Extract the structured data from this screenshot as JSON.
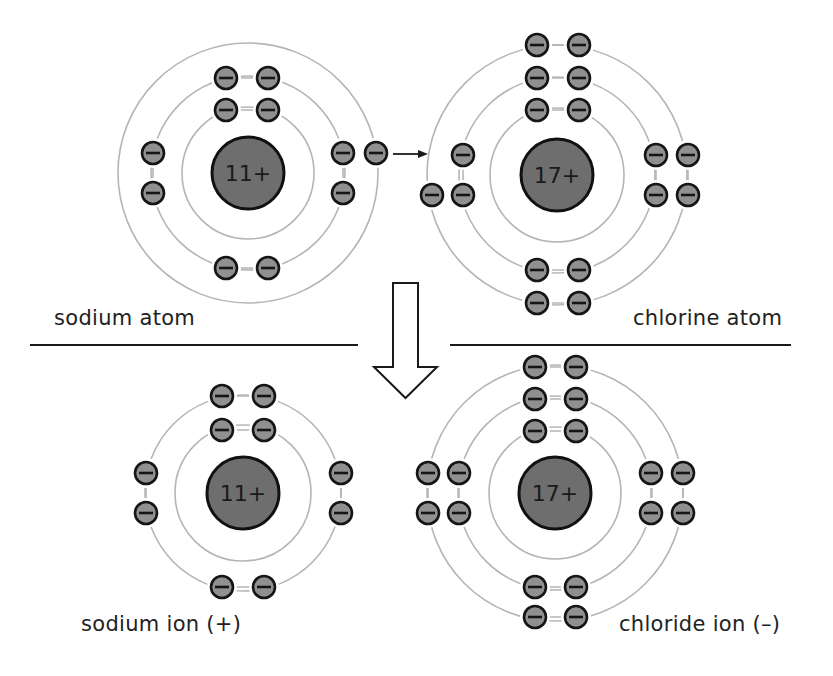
{
  "colors": {
    "shell": "#b5b5b5",
    "nucleus_fill": "#6e6e6e",
    "nucleus_stroke": "#111111",
    "electron_fill": "#909090",
    "electron_stroke": "#151515",
    "line": "#1a1a1a",
    "background": "#ffffff"
  },
  "labels": {
    "sodium_atom": "sodium atom",
    "chlorine_atom": "chlorine atom",
    "sodium_ion": "sodium ion (+)",
    "chloride_ion": "chloride ion (–)"
  },
  "atoms": [
    {
      "id": "sodium-atom",
      "charge_label": "11+",
      "center": [
        248,
        173
      ],
      "nucleus_radius": 36,
      "shell_radii": [
        66,
        97,
        130
      ],
      "electrons": [
        [
          226,
          78
        ],
        [
          268,
          78
        ],
        [
          226,
          110
        ],
        [
          268,
          110
        ],
        [
          153,
          153
        ],
        [
          153,
          193
        ],
        [
          343,
          153
        ],
        [
          343,
          193
        ],
        [
          376,
          153
        ],
        [
          226,
          268
        ],
        [
          268,
          268
        ]
      ],
      "pairs": [
        [
          0,
          1
        ],
        [
          2,
          3
        ],
        [
          9,
          10
        ],
        [
          4,
          5
        ],
        [
          6,
          7
        ]
      ]
    },
    {
      "id": "chlorine-atom",
      "charge_label": "17+",
      "center": [
        557,
        175
      ],
      "nucleus_radius": 36,
      "shell_radii": [
        67,
        98,
        130
      ],
      "electrons": [
        [
          537,
          45
        ],
        [
          579,
          45
        ],
        [
          537,
          78
        ],
        [
          579,
          78
        ],
        [
          537,
          110
        ],
        [
          579,
          110
        ],
        [
          463,
          155
        ],
        [
          463,
          195
        ],
        [
          432,
          195
        ],
        [
          656,
          155
        ],
        [
          656,
          195
        ],
        [
          688,
          155
        ],
        [
          688,
          195
        ],
        [
          537,
          270
        ],
        [
          579,
          270
        ],
        [
          537,
          303
        ],
        [
          579,
          303
        ]
      ],
      "pairs": [
        [
          0,
          1
        ],
        [
          2,
          3
        ],
        [
          4,
          5
        ],
        [
          13,
          14
        ],
        [
          15,
          16
        ],
        [
          6,
          7
        ],
        [
          9,
          10
        ],
        [
          11,
          12
        ]
      ]
    },
    {
      "id": "sodium-ion",
      "charge_label": "11+",
      "center": [
        243,
        493
      ],
      "nucleus_radius": 36,
      "shell_radii": [
        68,
        98
      ],
      "electrons": [
        [
          222,
          396
        ],
        [
          264,
          396
        ],
        [
          222,
          430
        ],
        [
          264,
          430
        ],
        [
          146,
          473
        ],
        [
          146,
          513
        ],
        [
          341,
          473
        ],
        [
          341,
          513
        ],
        [
          222,
          587
        ],
        [
          264,
          587
        ]
      ],
      "pairs": [
        [
          0,
          1
        ],
        [
          2,
          3
        ],
        [
          8,
          9
        ],
        [
          4,
          5
        ],
        [
          6,
          7
        ]
      ]
    },
    {
      "id": "chloride-ion",
      "charge_label": "17+",
      "center": [
        555,
        493
      ],
      "nucleus_radius": 36,
      "shell_radii": [
        66,
        97,
        128
      ],
      "electrons": [
        [
          535,
          367
        ],
        [
          576,
          367
        ],
        [
          535,
          399
        ],
        [
          576,
          399
        ],
        [
          535,
          431
        ],
        [
          576,
          431
        ],
        [
          428,
          473
        ],
        [
          459,
          473
        ],
        [
          428,
          513
        ],
        [
          459,
          513
        ],
        [
          651,
          473
        ],
        [
          683,
          473
        ],
        [
          651,
          513
        ],
        [
          683,
          513
        ],
        [
          535,
          587
        ],
        [
          576,
          587
        ],
        [
          535,
          617
        ],
        [
          576,
          617
        ]
      ],
      "pairs": [
        [
          0,
          1
        ],
        [
          2,
          3
        ],
        [
          4,
          5
        ],
        [
          14,
          15
        ],
        [
          16,
          17
        ],
        [
          6,
          8
        ],
        [
          7,
          9
        ],
        [
          10,
          12
        ],
        [
          11,
          13
        ]
      ]
    }
  ],
  "transfer_arrow": {
    "from": [
      393,
      154
    ],
    "to": [
      428,
      154
    ]
  },
  "reaction_arrow": {
    "shaft_left": 393,
    "shaft_right": 418,
    "top": 283,
    "shaft_bottom": 367,
    "head_left": 374,
    "head_right": 437,
    "tip_y": 398
  },
  "dividers": [
    {
      "x1": 30,
      "x2": 358,
      "y": 345
    },
    {
      "x1": 450,
      "x2": 791,
      "y": 345
    }
  ]
}
